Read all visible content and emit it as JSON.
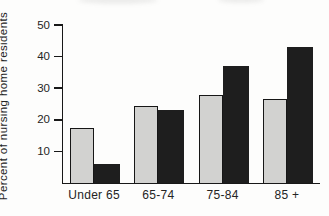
{
  "chart_data": {
    "type": "bar",
    "title": "",
    "ylabel": "Percent of nursing home residents",
    "xlabel": "",
    "categories": [
      "Under 65",
      "65-74",
      "75-84",
      "85 +"
    ],
    "series": [
      {
        "name": "light-gray-bars",
        "color": "#d2d2d0",
        "values": [
          17.5,
          24.5,
          28,
          26.5
        ]
      },
      {
        "name": "black-bars",
        "color": "#1e1e1e",
        "values": [
          6,
          23,
          37,
          43
        ]
      }
    ],
    "yticks": [
      10,
      20,
      30,
      40,
      50
    ],
    "ylim": [
      0,
      50
    ],
    "grid": false,
    "legend": "none"
  },
  "colors": {
    "axis": "#181818",
    "text": "#242424",
    "background": "#fdfdfc",
    "light_bar_fill": "#d2d2d0",
    "light_bar_border": "#161616",
    "dark_bar_fill": "#1e1e1e"
  }
}
